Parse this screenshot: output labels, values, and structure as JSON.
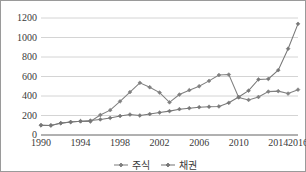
{
  "chart_data": {
    "type": "line",
    "title": "",
    "xlabel": "",
    "ylabel": "",
    "xlim": [
      1990,
      2016
    ],
    "ylim": [
      0,
      1200
    ],
    "ytick_values": [
      0,
      200,
      400,
      600,
      800,
      1000,
      1200
    ],
    "ytick_labels": [
      "0",
      "200",
      "400",
      "600",
      "800",
      "1000",
      "1200"
    ],
    "xtick_values": [
      1990,
      1994,
      1998,
      2002,
      2006,
      2010,
      2014,
      2016
    ],
    "xtick_labels": [
      "1990",
      "1994",
      "1998",
      "2002",
      "2006",
      "2010",
      "2014",
      "2016"
    ],
    "x": [
      1990,
      1991,
      1992,
      1993,
      1994,
      1995,
      1996,
      1997,
      1998,
      1999,
      2000,
      2001,
      2002,
      2003,
      2004,
      2005,
      2006,
      2007,
      2008,
      2009,
      2010,
      2011,
      2012,
      2013,
      2014,
      2015,
      2016
    ],
    "grid": true,
    "grid_axis": "y",
    "legend_position": "bottom",
    "marker": "diamond",
    "series": [
      {
        "name": "주식",
        "color": "#808080",
        "values": [
          100,
          98,
          120,
          133,
          140,
          138,
          205,
          255,
          345,
          440,
          535,
          490,
          435,
          335,
          415,
          460,
          500,
          555,
          615,
          620,
          385,
          360,
          390,
          445,
          450,
          425,
          465
        ]
      },
      {
        "name": "채권",
        "color": "#777777",
        "values": [
          100,
          98,
          122,
          133,
          142,
          148,
          160,
          175,
          195,
          210,
          200,
          215,
          230,
          245,
          265,
          275,
          285,
          290,
          293,
          330,
          390,
          455,
          570,
          575,
          665,
          885,
          1140
        ]
      }
    ]
  },
  "legend": {
    "entries": [
      {
        "label": "주식"
      },
      {
        "label": "채권"
      }
    ]
  },
  "colors": {
    "series_primary": "#808080",
    "series_secondary": "#777777",
    "gridline": "#c9c9c9",
    "axis": "#8f8f8f",
    "text": "#3a3a3a",
    "border": "#9a9a9a",
    "background": "#ffffff"
  }
}
